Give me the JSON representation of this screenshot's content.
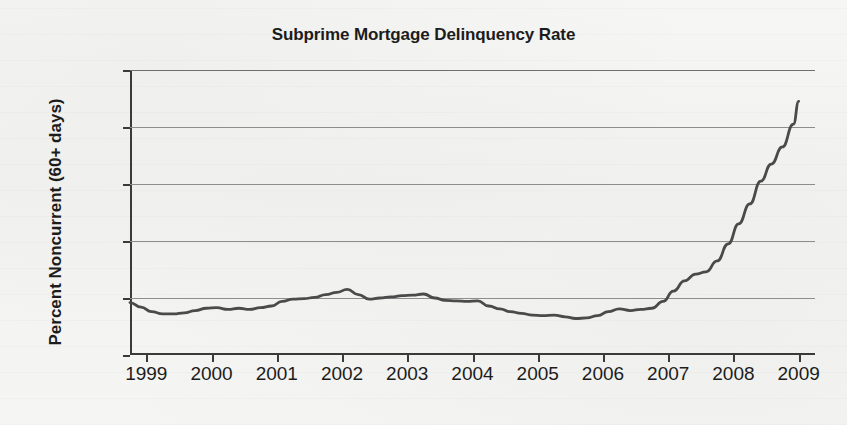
{
  "chart_data": {
    "type": "line",
    "title": "Subprime Mortgage Delinquency Rate",
    "xlabel": "",
    "ylabel": "Percent Noncurrent (60+ days)",
    "xlim": [
      1998.75,
      2009.25
    ],
    "ylim": [
      0,
      50
    ],
    "grid": true,
    "legend": null,
    "y_ticks": [
      0,
      10,
      20,
      30,
      40,
      50
    ],
    "y_tick_labels": [
      "0%",
      "10%",
      "20%",
      "30%",
      "40%",
      "50%"
    ],
    "x_ticks": [
      1999,
      2000,
      2001,
      2002,
      2003,
      2004,
      2005,
      2006,
      2007,
      2008,
      2009
    ],
    "x_tick_labels": [
      "1999",
      "2000",
      "2001",
      "2002",
      "2003",
      "2004",
      "2005",
      "2006",
      "2007",
      "2008",
      "2009"
    ],
    "series": [
      {
        "name": "Percent Noncurrent (60+ days)",
        "color": "#4a4a4a",
        "x": [
          1998.75,
          1998.92,
          1999.08,
          1999.25,
          1999.42,
          1999.58,
          1999.75,
          1999.92,
          2000.08,
          2000.25,
          2000.42,
          2000.58,
          2000.75,
          2000.92,
          2001.08,
          2001.25,
          2001.42,
          2001.58,
          2001.75,
          2001.92,
          2002.08,
          2002.25,
          2002.42,
          2002.58,
          2002.75,
          2002.92,
          2003.08,
          2003.25,
          2003.42,
          2003.58,
          2003.75,
          2003.92,
          2004.08,
          2004.25,
          2004.42,
          2004.58,
          2004.75,
          2004.92,
          2005.08,
          2005.25,
          2005.42,
          2005.58,
          2005.75,
          2005.92,
          2006.08,
          2006.25,
          2006.42,
          2006.58,
          2006.75,
          2006.92,
          2007.08,
          2007.25,
          2007.42,
          2007.58,
          2007.75,
          2007.92,
          2008.08,
          2008.25,
          2008.42,
          2008.58,
          2008.75,
          2008.92,
          2009.0
        ],
        "y": [
          9.2,
          8.4,
          7.6,
          7.2,
          7.2,
          7.4,
          7.8,
          8.2,
          8.3,
          8.0,
          8.2,
          8.0,
          8.3,
          8.6,
          9.4,
          9.8,
          9.9,
          10.1,
          10.6,
          11.0,
          11.5,
          10.6,
          9.8,
          10.0,
          10.2,
          10.4,
          10.5,
          10.7,
          10.0,
          9.6,
          9.5,
          9.4,
          9.5,
          8.6,
          8.1,
          7.6,
          7.3,
          7.0,
          6.9,
          7.0,
          6.7,
          6.4,
          6.5,
          6.9,
          7.6,
          8.1,
          7.8,
          8.0,
          8.2,
          9.4,
          11.2,
          13.0,
          14.2,
          14.6,
          16.5,
          19.5,
          23.0,
          26.5,
          30.5,
          33.5,
          36.5,
          40.5,
          44.5
        ]
      }
    ],
    "annotations": []
  },
  "chart": {
    "title": "Subprime Mortgage Delinquency Rate",
    "y_axis_title": "Percent Noncurrent (60+ days)"
  }
}
